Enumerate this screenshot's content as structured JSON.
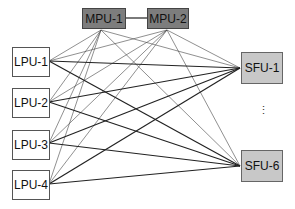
{
  "diagram": {
    "mpus": [
      {
        "id": "mpu1",
        "label": "MPU-1",
        "x": 82,
        "y": 8,
        "w": 44,
        "h": 21,
        "anchor": [
          101,
          30
        ]
      },
      {
        "id": "mpu2",
        "label": "MPU-2",
        "x": 147,
        "y": 8,
        "w": 42,
        "h": 21,
        "anchor": [
          167,
          30
        ]
      }
    ],
    "lpus": [
      {
        "id": "lpu1",
        "label": "LPU-1",
        "x": 12,
        "y": 47,
        "w": 38,
        "h": 30,
        "anchor": [
          49,
          61
        ]
      },
      {
        "id": "lpu2",
        "label": "LPU-2",
        "x": 12,
        "y": 88,
        "w": 38,
        "h": 30,
        "anchor": [
          49,
          102
        ]
      },
      {
        "id": "lpu3",
        "label": "LPU-3",
        "x": 12,
        "y": 130,
        "w": 38,
        "h": 30,
        "anchor": [
          49,
          143
        ]
      },
      {
        "id": "lpu4",
        "label": "LPU-4",
        "x": 12,
        "y": 170,
        "w": 38,
        "h": 30,
        "anchor": [
          49,
          184
        ]
      }
    ],
    "sfus": [
      {
        "id": "sfu1",
        "label": "SFU-1",
        "x": 241,
        "y": 52,
        "w": 42,
        "h": 32,
        "anchor": [
          240,
          68
        ]
      },
      {
        "id": "sfu6",
        "label": "SFU-6",
        "x": 241,
        "y": 150,
        "w": 42,
        "h": 32,
        "anchor": [
          240,
          166
        ]
      }
    ],
    "ellipsis": "⋮",
    "colors": {
      "mpu_fill": "#7d7d7d",
      "sfu_fill": "#c8c8c8",
      "lpu_fill": "#ffffff",
      "thin_line": "#444444",
      "thick_line": "#222222"
    }
  }
}
